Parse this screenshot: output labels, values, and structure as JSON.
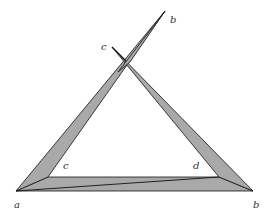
{
  "diagram": {
    "type": "geometric-figure",
    "colors": {
      "fill": "#a9a9a9",
      "stroke": "#111111",
      "background": "#ffffff"
    },
    "labels": {
      "bottom_left_a": "a",
      "bottom_right_b": "b",
      "top_b": "b",
      "top_c": "c",
      "inner_c": "c",
      "inner_d": "d"
    }
  }
}
